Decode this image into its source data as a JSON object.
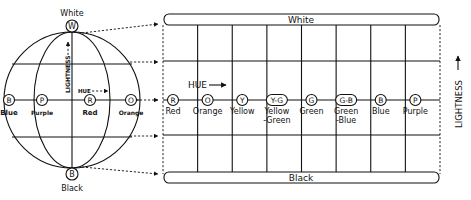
{
  "sphere": {
    "top_pole": {
      "letter": "W",
      "label": "White"
    },
    "bottom_pole": {
      "letter": "B",
      "label": "Black"
    },
    "lightness_label": "LIGHTNESS",
    "hue_label": "HUE",
    "equator_points": [
      {
        "letter": "B",
        "label": "Blue"
      },
      {
        "letter": "P",
        "label": "Purple"
      },
      {
        "letter": "R",
        "label": "Red"
      },
      {
        "letter": "O",
        "label": "Orange"
      }
    ]
  },
  "grid": {
    "top_bar_label": "White",
    "bottom_bar_label": "Black",
    "hue_label": "HUE",
    "lightness_label": "LIGHTNESS",
    "hues": [
      {
        "letter": "R",
        "label": "Red"
      },
      {
        "letter": "O",
        "label": "Orange"
      },
      {
        "letter": "Y",
        "label": "Yellow"
      },
      {
        "letter": "Y-G",
        "label": "Yellow\n-Green"
      },
      {
        "letter": "G",
        "label": "Green"
      },
      {
        "letter": "G-B",
        "label": "Green\n-Blue"
      },
      {
        "letter": "B",
        "label": "Blue"
      },
      {
        "letter": "P",
        "label": "Purple"
      }
    ]
  }
}
